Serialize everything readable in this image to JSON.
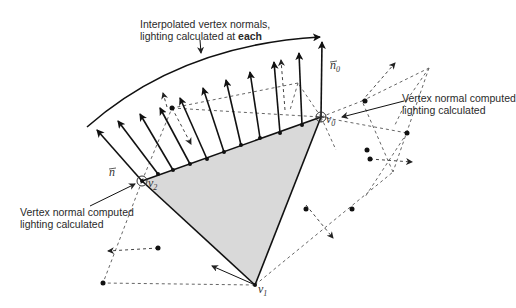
{
  "diagram": {
    "annotations": {
      "top": {
        "line1": "Interpolated vertex normals,",
        "line2_prefix": "lighting calculated at ",
        "line2_bold": "each"
      },
      "right": {
        "line1": "Vertex normal computed",
        "line2": "lighting calculated"
      },
      "left": {
        "line1": "Vertex normal computed",
        "line2": "lighting calculated"
      }
    },
    "vertex_labels": {
      "v0": {
        "base": "v",
        "sub": "0"
      },
      "v1": {
        "base": "v",
        "sub": "1"
      },
      "v2": {
        "base": "v",
        "sub": "2"
      }
    },
    "normal_labels": {
      "n": "n",
      "n0": {
        "base": "n",
        "sub": "0"
      }
    },
    "colors": {
      "triangle_fill": "#d9d9d9",
      "stroke": "#111111",
      "dashed": "#555555"
    }
  }
}
